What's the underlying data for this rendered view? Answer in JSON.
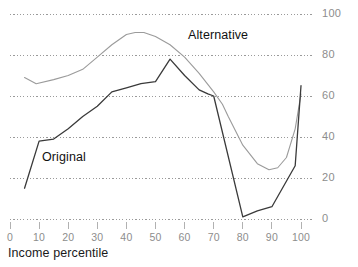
{
  "chart_data": {
    "type": "line",
    "title": "",
    "subtitle": "",
    "xlabel": "Income percentile",
    "ylabel": "",
    "xlim": [
      0,
      110
    ],
    "ylim": [
      0,
      100
    ],
    "grid": true,
    "grid_style": "dotted-horizontal",
    "legend_position": "inline-annotation",
    "x_ticks": [
      0,
      10,
      20,
      30,
      40,
      50,
      60,
      70,
      80,
      90,
      100
    ],
    "x_tick_labels": [
      "0",
      "10",
      "20",
      "30",
      "40",
      "50",
      "60",
      "70",
      "80",
      "90",
      "100"
    ],
    "y_ticks": [
      0,
      20,
      40,
      60,
      80,
      100
    ],
    "y_tick_labels": [
      "0",
      "20",
      "40",
      "60",
      "80",
      "100"
    ],
    "y_axis_side": "right",
    "series": [
      {
        "name": "Alternative",
        "color": "#9b9b9b",
        "width": 1.1,
        "x": [
          5,
          9,
          15,
          20,
          25,
          30,
          35,
          40,
          43,
          46,
          50,
          55,
          60,
          65,
          70,
          73,
          75,
          80,
          85,
          89,
          92,
          95,
          98,
          100
        ],
        "values": [
          69,
          66,
          68,
          70,
          73,
          79,
          85,
          90,
          91,
          91,
          89,
          85,
          79,
          71,
          62,
          56,
          50,
          36,
          27,
          24,
          25,
          30,
          44,
          61
        ]
      },
      {
        "name": "Original",
        "color": "#3a3a3a",
        "width": 1.3,
        "x": [
          5,
          10,
          15,
          20,
          25,
          30,
          35,
          40,
          45,
          50,
          55,
          60,
          65,
          68,
          70,
          80,
          85,
          90,
          98,
          100
        ],
        "values": [
          15,
          38,
          39,
          44,
          50,
          55,
          62,
          64,
          66,
          67,
          78,
          70,
          63,
          61,
          60,
          1,
          4,
          6,
          26,
          65
        ]
      }
    ],
    "annotations": [
      {
        "text": "Alternative",
        "x": 66,
        "y": 93
      },
      {
        "text": "Original",
        "x": 16,
        "y": 34
      }
    ]
  },
  "axis": {
    "x_title": "Income percentile"
  },
  "colors": {
    "alternative_line": "#9b9b9b",
    "original_line": "#3a3a3a",
    "gridline": "#9a9a9a",
    "tick_text": "#8d8d8d",
    "label_text": "#111111"
  }
}
